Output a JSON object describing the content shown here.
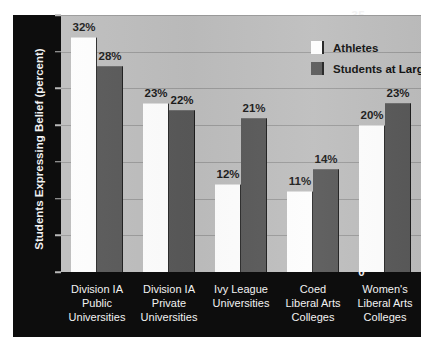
{
  "chart_data": {
    "type": "bar",
    "title": "",
    "xlabel": "",
    "ylabel": "Students Expressing Belief (percent)",
    "ylim": [
      0,
      35
    ],
    "yticks": [
      0,
      5,
      10,
      15,
      20,
      25,
      30,
      35
    ],
    "ytick_labels": [
      "0",
      "5",
      "10",
      "15",
      "20",
      "25",
      "30",
      "35"
    ],
    "grid": true,
    "legend_position": "upper right",
    "categories": [
      "Division IA\nPublic\nUniversities",
      "Division IA\nPrivate\nUniversities",
      "Ivy League\nUniversities",
      "Coed\nLiberal Arts\nColleges",
      "Women's\nLiberal Arts\nColleges"
    ],
    "category_lines": [
      [
        "Division IA",
        "Public",
        "Universities"
      ],
      [
        "Division IA",
        "Private",
        "Universities"
      ],
      [
        "Ivy League",
        "Universities"
      ],
      [
        "Coed",
        "Liberal Arts",
        "Colleges"
      ],
      [
        "Women's",
        "Liberal Arts",
        "Colleges"
      ]
    ],
    "series": [
      {
        "name": "Athletes",
        "color": "#fdfdfd",
        "values": [
          32,
          23,
          12,
          11,
          20
        ],
        "labels": [
          "32%",
          "23%",
          "12%",
          "11%",
          "20%"
        ]
      },
      {
        "name": "Students at Large",
        "color": "#585858",
        "values": [
          28,
          22,
          21,
          14,
          23
        ],
        "labels": [
          "28%",
          "22%",
          "21%",
          "14%",
          "23%"
        ]
      }
    ]
  },
  "colors": {
    "plot_background": "#bdbdbd",
    "axis_backing": "#0d0d0d",
    "gridline": "#9a9a9a",
    "athletes_bar": "#fdfdfd",
    "students_at_large_bar": "#585858",
    "axis_text": "#f2f2f2",
    "value_text": "#1a1a1a"
  }
}
